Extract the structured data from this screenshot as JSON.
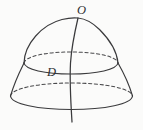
{
  "figure": {
    "kind": "solid-of-revolution-diagram",
    "background_color": "#fbfbfa",
    "line_color": "#3a3a3c",
    "dashed_line_color": "#4a4a4c",
    "canvas": {
      "width": 143,
      "height": 130
    },
    "labels": {
      "apex": "O",
      "interior_point": "D"
    },
    "parts": {
      "dome_outline": "dome-outline",
      "axis": "vertical-axis",
      "upper_cross_section": "upper-cross-section-ellipse",
      "lower_cross_section": "lower-cross-section-ellipse",
      "lower_side_left": "lower-side-left",
      "lower_side_right": "lower-side-right"
    },
    "geometry": {
      "apex_point": {
        "x": 78,
        "y": 18
      },
      "axis_bottom_point": {
        "x": 72,
        "y": 122
      },
      "upper_ellipse": {
        "cx": 71,
        "cy": 63,
        "rx": 47,
        "ry": 11
      },
      "lower_ellipse": {
        "cx": 71.5,
        "cy": 96,
        "rx": 61,
        "ry": 13
      }
    }
  }
}
